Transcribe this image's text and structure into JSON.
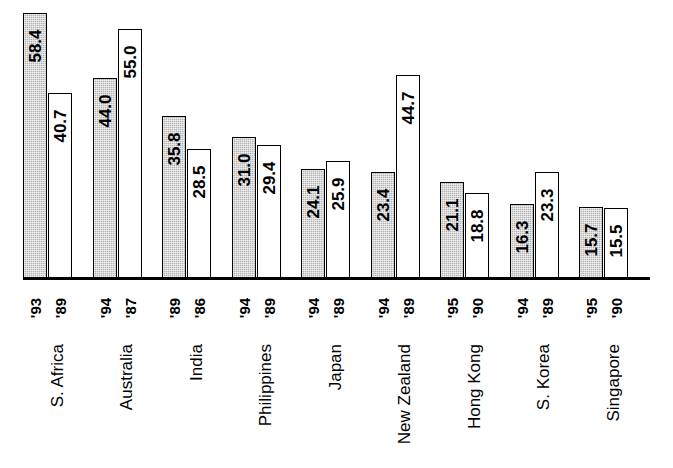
{
  "chart_data": {
    "type": "bar",
    "title": "",
    "subtitle": "",
    "xlabel": "",
    "ylabel": "",
    "ylim": [
      0,
      60
    ],
    "grid": false,
    "legend": "none",
    "orientation": "vertical",
    "grouped": true,
    "categories": [
      "S. Africa",
      "Australia",
      "India",
      "Philippines",
      "Japan",
      "New Zealand",
      "Hong Kong",
      "S. Korea",
      "Singapore"
    ],
    "series": [
      {
        "name": "recent year",
        "style": "gray",
        "values": [
          58.4,
          44.0,
          35.8,
          31.0,
          24.1,
          23.4,
          21.1,
          16.3,
          15.7
        ],
        "year_labels": [
          "'93",
          "'94",
          "'89",
          "'94",
          "'94",
          "'94",
          "'95",
          "'94",
          "'95"
        ]
      },
      {
        "name": "earlier year",
        "style": "white",
        "values": [
          40.7,
          55.0,
          28.5,
          29.4,
          25.9,
          44.7,
          18.8,
          23.3,
          15.5
        ],
        "year_labels": [
          "'89",
          "'87",
          "'86",
          "'89",
          "'89",
          "'89",
          "'90",
          "'89",
          "'90"
        ]
      }
    ],
    "groups": [
      {
        "category": "S. Africa",
        "bars": [
          {
            "value": "58.4",
            "year": "'93",
            "style": "gray"
          },
          {
            "value": "40.7",
            "year": "'89",
            "style": "white"
          }
        ]
      },
      {
        "category": "Australia",
        "bars": [
          {
            "value": "44.0",
            "year": "'94",
            "style": "gray"
          },
          {
            "value": "55.0",
            "year": "'87",
            "style": "white"
          }
        ]
      },
      {
        "category": "India",
        "bars": [
          {
            "value": "35.8",
            "year": "'89",
            "style": "gray"
          },
          {
            "value": "28.5",
            "year": "'86",
            "style": "white"
          }
        ]
      },
      {
        "category": "Philippines",
        "bars": [
          {
            "value": "31.0",
            "year": "'94",
            "style": "gray"
          },
          {
            "value": "29.4",
            "year": "'89",
            "style": "white"
          }
        ]
      },
      {
        "category": "Japan",
        "bars": [
          {
            "value": "24.1",
            "year": "'94",
            "style": "gray"
          },
          {
            "value": "25.9",
            "year": "'89",
            "style": "white"
          }
        ]
      },
      {
        "category": "New Zealand",
        "bars": [
          {
            "value": "23.4",
            "year": "'94",
            "style": "gray"
          },
          {
            "value": "44.7",
            "year": "'89",
            "style": "white"
          }
        ]
      },
      {
        "category": "Hong Kong",
        "bars": [
          {
            "value": "21.1",
            "year": "'95",
            "style": "gray"
          },
          {
            "value": "18.8",
            "year": "'90",
            "style": "white"
          }
        ]
      },
      {
        "category": "S. Korea",
        "bars": [
          {
            "value": "16.3",
            "year": "'94",
            "style": "gray"
          },
          {
            "value": "23.3",
            "year": "'89",
            "style": "white"
          }
        ]
      },
      {
        "category": "Singapore",
        "bars": [
          {
            "value": "15.7",
            "year": "'95",
            "style": "gray"
          },
          {
            "value": "15.5",
            "year": "'90",
            "style": "white"
          }
        ]
      }
    ],
    "colors": {
      "gray_bar": "#b3b3b3",
      "white_bar": "#ffffff",
      "outline": "#000000",
      "background": "#ffffff",
      "text": "#000000"
    }
  }
}
